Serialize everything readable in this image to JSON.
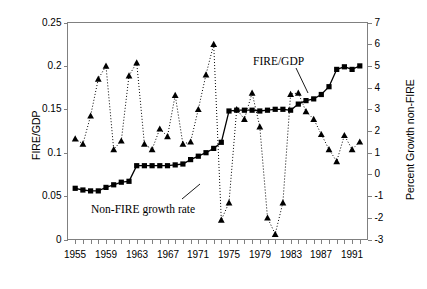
{
  "chart_data": {
    "type": "line",
    "title": "",
    "xlabel": "",
    "ylabel": "FIRE/GDP",
    "y2label": "Percent Growth non-FIRE",
    "xlim": [
      1954,
      1993
    ],
    "ylim": [
      0,
      0.25
    ],
    "y2lim": [
      -3,
      7
    ],
    "grid": false,
    "legend": "annotated-inline",
    "x_ticks": [
      1955,
      1959,
      1963,
      1967,
      1971,
      1975,
      1979,
      1983,
      1987,
      1991
    ],
    "x_tick_labels": [
      "1955",
      "1959",
      "1963",
      "1967",
      "1971",
      "1975",
      "1979",
      "1983",
      "1987",
      "1991"
    ],
    "y_ticks": [
      0,
      0.05,
      0.1,
      0.15,
      0.2,
      0.25
    ],
    "y_tick_labels": [
      "0",
      "0.05",
      "0.1",
      "0.15",
      "0.2",
      "0.25"
    ],
    "y2_ticks": [
      -3,
      -2,
      -1,
      0,
      1,
      2,
      3,
      4,
      5,
      6,
      7
    ],
    "y2_tick_labels": [
      "-3",
      "-2",
      "-1",
      "0",
      "1",
      "2",
      "3",
      "4",
      "5",
      "6",
      "7"
    ],
    "annotations": [
      {
        "text": "FIRE/GDP",
        "x": 1984.2,
        "y": 0.206
      },
      {
        "text": "Non-FIRE growth rate",
        "x": 1963.0,
        "y": 0.028
      }
    ],
    "series": [
      {
        "name": "FIRE/GDP",
        "axis": "left",
        "marker": "square",
        "line": "solid",
        "color": "#000000",
        "x": [
          1955,
          1956,
          1957,
          1958,
          1959,
          1960,
          1961,
          1962,
          1963,
          1964,
          1965,
          1966,
          1967,
          1968,
          1969,
          1970,
          1971,
          1972,
          1973,
          1974,
          1975,
          1976,
          1977,
          1978,
          1979,
          1980,
          1981,
          1982,
          1983,
          1984,
          1985,
          1986,
          1987,
          1988,
          1989,
          1990,
          1991,
          1992
        ],
        "values": [
          0.059,
          0.057,
          0.056,
          0.056,
          0.06,
          0.063,
          0.066,
          0.067,
          0.085,
          0.085,
          0.085,
          0.085,
          0.085,
          0.086,
          0.087,
          0.092,
          0.096,
          0.1,
          0.105,
          0.112,
          0.148,
          0.149,
          0.149,
          0.149,
          0.148,
          0.149,
          0.15,
          0.15,
          0.149,
          0.156,
          0.16,
          0.162,
          0.167,
          0.176,
          0.196,
          0.199,
          0.196,
          0.2
        ]
      },
      {
        "name": "Non-FIRE growth rate",
        "axis": "right",
        "marker": "triangle",
        "line": "dotted",
        "color": "#000000",
        "x": [
          1955,
          1956,
          1957,
          1958,
          1959,
          1960,
          1961,
          1962,
          1963,
          1964,
          1965,
          1966,
          1967,
          1968,
          1969,
          1970,
          1971,
          1972,
          1973,
          1974,
          1975,
          1976,
          1977,
          1978,
          1979,
          1980,
          1981,
          1982,
          1983,
          1984,
          1985,
          1986,
          1987,
          1988,
          1989,
          1990,
          1991,
          1992
        ],
        "values": [
          1.65,
          1.4,
          2.7,
          4.4,
          5.0,
          1.15,
          1.55,
          4.55,
          5.15,
          1.4,
          1.15,
          2.1,
          1.75,
          3.65,
          1.4,
          1.5,
          3.0,
          4.6,
          6.0,
          -2.1,
          -1.3,
          3.0,
          2.55,
          3.75,
          2.2,
          -2.0,
          -2.75,
          -1.3,
          3.7,
          3.75,
          2.9,
          2.55,
          1.85,
          1.15,
          0.6,
          1.8,
          1.15,
          1.5
        ]
      }
    ]
  },
  "axis_titles": {
    "left": "FIRE/GDP",
    "right": "Percent Growth non-FIRE"
  },
  "labels": {
    "fire_gdp": "FIRE/GDP",
    "non_fire": "Non-FIRE growth rate"
  }
}
